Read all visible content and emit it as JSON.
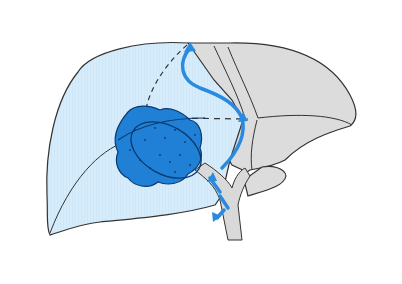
{
  "diagram": {
    "labels": [],
    "colors": {
      "background": "#ffffff",
      "right_lobe_fill": "#d6ecfb",
      "left_lobe_fill": "#dcdcdc",
      "tumor_fill": "#1f80d6",
      "tumor_stroke": "#0b3a70",
      "arrow": "#2a8ae0",
      "outline": "#333333",
      "bile_duct_fill": "#d9d9d9"
    },
    "elements": [
      {
        "name": "right-lobe",
        "description": "light blue hatched region"
      },
      {
        "name": "left-lobe",
        "description": "gray region"
      },
      {
        "name": "tumor-mass",
        "description": "blue lobulated mass"
      },
      {
        "name": "drainage-arrows",
        "description": "blue arrows along bile ducts"
      },
      {
        "name": "dashed-lines",
        "description": "segment boundaries"
      }
    ]
  }
}
